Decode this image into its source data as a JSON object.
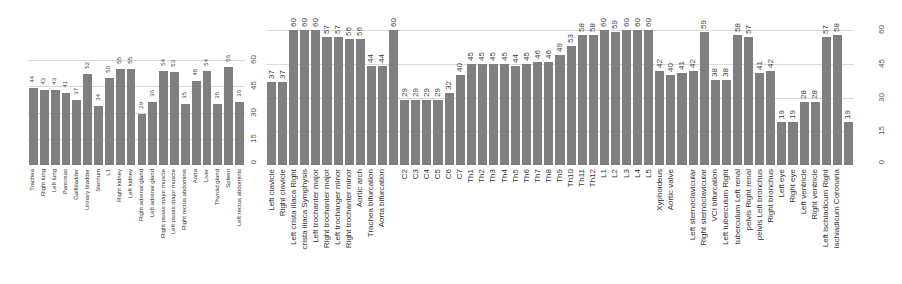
{
  "chart_data": [
    {
      "type": "bar",
      "title": "",
      "xlabel": "",
      "ylabel": "",
      "ylim": [
        0,
        60
      ],
      "yticks": [
        0,
        15,
        30,
        45,
        60
      ],
      "grid": true,
      "bar_color": "#7f7f7f",
      "categories": [
        "Trachea",
        "Right lung",
        "Left lung",
        "Pancreas",
        "Gallbladder",
        "Urinary bladder",
        "Sternum",
        "L1",
        "Right kidney",
        "Left kidney",
        "Right adrenal gland",
        "Left adrenal gland",
        "Right psoas major muscle",
        "Left psoas major muscle",
        "Right rectus abdominis",
        "Aorta",
        "Liver",
        "Thyroid gland",
        "Spleen",
        "Left rectus abdominis"
      ],
      "values": [
        44,
        43,
        43,
        41,
        37,
        52,
        34,
        50,
        55,
        55,
        29,
        36,
        54,
        53,
        35,
        48,
        54,
        35,
        56,
        36
      ]
    },
    {
      "type": "bar",
      "title": "",
      "xlabel": "",
      "ylabel": "",
      "ylim": [
        0,
        60
      ],
      "yticks": [
        0,
        15,
        30,
        45,
        60
      ],
      "grid": true,
      "bar_color": "#7f7f7f",
      "categories": [
        "Left clavicle",
        "Right clavicle",
        "Left crista iliaca Right",
        "crista iliaca Symphysis",
        "Left trochanter major",
        "Right trochanter major",
        "Left trochanger minor",
        "Right trochanter minor",
        "Aortic arch",
        "Trachea bifurcation",
        "Aorta bifurcation",
        "",
        "C2",
        "C3",
        "C4",
        "C5",
        "C6",
        "C7",
        "Th1",
        "Th2",
        "Th3",
        "Th4",
        "Th5",
        "Th6",
        "Th7",
        "Th8",
        "Th9",
        "Th10",
        "Th11",
        "Th12",
        "L1",
        "L2",
        "L3",
        "L4",
        "L5",
        "Xyphoideus",
        "Aortic valve",
        "",
        "Left sternoclavicular",
        "Right sternoclavicular",
        "VCI bifurcation",
        "Left tuberculum Right",
        "tuberculum Left renal",
        "pelvis Right renal",
        "pelvis Left bronchus",
        "Right bronchus",
        "Left eye",
        "Right eye",
        "Left ventricle",
        "Right ventricle",
        "Left ischiadicum Right",
        "ischiadicum Coronaria",
        ""
      ],
      "values": [
        37,
        37,
        60,
        60,
        60,
        57,
        57,
        56,
        56,
        44,
        44,
        60,
        29,
        29,
        29,
        29,
        32,
        40,
        45,
        45,
        45,
        45,
        44,
        45,
        46,
        46,
        49,
        53,
        58,
        58,
        60,
        59,
        60,
        60,
        60,
        42,
        40,
        41,
        42,
        59,
        38,
        38,
        58,
        57,
        41,
        42,
        19,
        19,
        28,
        28,
        57,
        58,
        19
      ]
    }
  ]
}
